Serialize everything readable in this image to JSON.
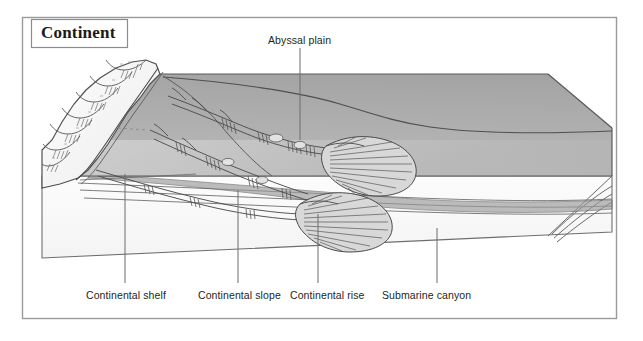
{
  "figure": {
    "kind": "geology-block-diagram",
    "background_color": "#ffffff",
    "frame": {
      "name": "figure-border",
      "x": 22,
      "y": 17,
      "width": 595,
      "height": 302,
      "stroke": "#9a9a9a"
    }
  },
  "title_box": {
    "label": "Continent",
    "box": {
      "x": 31,
      "y": 19,
      "width": 97,
      "height": 29
    },
    "border_color": "#8c8c8c",
    "text_color": "#1a1a1a"
  },
  "labels": {
    "abyssal_plain": {
      "text": "Abyssal plain",
      "x": 268,
      "y": 34,
      "leader": {
        "x1": 300,
        "y1": 48,
        "x2": 300,
        "y2": 140
      }
    },
    "continental_shelf": {
      "text": "Continental shelf",
      "x": 86,
      "y": 289,
      "leader": {
        "x1": 125,
        "y1": 174,
        "x2": 125,
        "y2": 283
      }
    },
    "continental_slope": {
      "text": "Continental slope",
      "x": 198,
      "y": 289,
      "leader": {
        "x1": 238,
        "y1": 190,
        "x2": 238,
        "y2": 283
      }
    },
    "continental_rise": {
      "text": "Continental rise",
      "x": 290,
      "y": 289,
      "leader": {
        "x1": 318,
        "y1": 214,
        "x2": 318,
        "y2": 283
      }
    },
    "submarine_canyon": {
      "text": "Submarine canyon",
      "x": 382,
      "y": 289,
      "leader": {
        "x1": 437,
        "y1": 228,
        "x2": 437,
        "y2": 283
      }
    }
  },
  "colors": {
    "water_upper": "#a8a8a8",
    "water_lower": "#b5b5b5",
    "seafloor_top": "#c6c6c6",
    "seafloor_light": "#d2d2d2",
    "side_face": "#cfcfcf",
    "side_face_light": "#dedede",
    "front_face": "#fbfbfb",
    "land": "#f4f4f4",
    "ink": "#4a4a4a",
    "ink_dark": "#333333",
    "label_text": "#231f20",
    "frame": "#9a9a9a"
  },
  "block": {
    "top_back_left": {
      "x": 160,
      "y": 74
    },
    "top_back_right": {
      "x": 548,
      "y": 74
    },
    "right_corner": {
      "x": 612,
      "y": 128
    },
    "front_right": {
      "x": 612,
      "y": 176
    },
    "front_left": {
      "x": 42,
      "y": 176
    },
    "bottom_left": {
      "x": 42,
      "y": 258
    },
    "bottom_right": {
      "x": 612,
      "y": 232
    }
  },
  "features": {
    "canyon_count": 3,
    "deep_sea_fan_count": 2,
    "fan_positions": [
      {
        "x": 370,
        "y": 148
      },
      {
        "x": 345,
        "y": 206
      }
    ]
  }
}
